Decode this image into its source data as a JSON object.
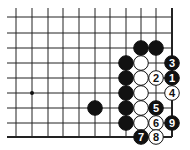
{
  "diagram": {
    "type": "go-board-problem",
    "board": {
      "x_lines": [
        16,
        32,
        48,
        63,
        79,
        95,
        110,
        126,
        141,
        156,
        172
      ],
      "y_lines": [
        17,
        33,
        48,
        63,
        78,
        93,
        108,
        123,
        137
      ],
      "line_start_x": 7,
      "line_start_y": 8,
      "right_edge_x": 172,
      "bottom_edge_y": 137,
      "stone_radius": 7.3,
      "line_color": "#222222"
    },
    "star_points": [
      {
        "x": 32,
        "y": 93
      }
    ],
    "stones": [
      {
        "color": "black",
        "x": 141,
        "y": 48,
        "label": ""
      },
      {
        "color": "black",
        "x": 156,
        "y": 48,
        "label": ""
      },
      {
        "color": "black",
        "x": 126,
        "y": 63,
        "label": ""
      },
      {
        "color": "black",
        "x": 126,
        "y": 78,
        "label": ""
      },
      {
        "color": "black",
        "x": 126,
        "y": 93,
        "label": ""
      },
      {
        "color": "black",
        "x": 126,
        "y": 108,
        "label": ""
      },
      {
        "color": "black",
        "x": 126,
        "y": 123,
        "label": ""
      },
      {
        "color": "black",
        "x": 95,
        "y": 108,
        "label": ""
      },
      {
        "color": "white",
        "x": 141,
        "y": 63,
        "label": ""
      },
      {
        "color": "white",
        "x": 141,
        "y": 78,
        "label": ""
      },
      {
        "color": "white",
        "x": 141,
        "y": 93,
        "label": ""
      },
      {
        "color": "white",
        "x": 141,
        "y": 108,
        "label": ""
      },
      {
        "color": "white",
        "x": 141,
        "y": 123,
        "label": ""
      },
      {
        "color": "black",
        "x": 172,
        "y": 78,
        "label": "1"
      },
      {
        "color": "white",
        "x": 156,
        "y": 78,
        "label": "2"
      },
      {
        "color": "black",
        "x": 172,
        "y": 63,
        "label": "3"
      },
      {
        "color": "white",
        "x": 172,
        "y": 93,
        "label": "4"
      },
      {
        "color": "black",
        "x": 156,
        "y": 108,
        "label": "5"
      },
      {
        "color": "white",
        "x": 156,
        "y": 123,
        "label": "6"
      },
      {
        "color": "black",
        "x": 141,
        "y": 137,
        "label": "7"
      },
      {
        "color": "white",
        "x": 156,
        "y": 137,
        "label": "8"
      },
      {
        "color": "black",
        "x": 172,
        "y": 123,
        "label": "9"
      }
    ]
  }
}
